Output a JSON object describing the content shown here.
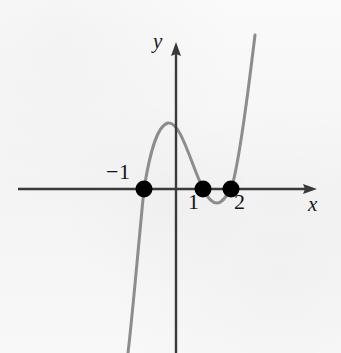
{
  "figure": {
    "kind": "cartesian-graph",
    "background_color": "#f7f7f7",
    "width": 341,
    "height": 353
  },
  "axes": {
    "x_axis": {
      "label": "x",
      "color": "#3a3a3a",
      "y_pixel": 189,
      "x_start_pixel": 18,
      "x_end_pixel": 317,
      "arrow": "right"
    },
    "y_axis": {
      "label": "y",
      "color": "#3a3a3a",
      "x_pixel": 176,
      "y_start_pixel": 42,
      "y_end_pixel": 353,
      "arrow": "up"
    },
    "origin_pixel": {
      "x": 176,
      "y": 189
    },
    "pixels_per_unit_x": 28,
    "pixels_per_unit_y": 28
  },
  "tick_labels": [
    {
      "text": "−1",
      "value": -1,
      "position": "above-left"
    },
    {
      "text": "1",
      "value": 1,
      "position": "below-left"
    },
    {
      "text": "2",
      "value": 2,
      "position": "below-right"
    }
  ],
  "curve": {
    "color": "#8d8d8d",
    "stroke_width": 3,
    "description": "quartic-like polynomial with roots at x = -1, x = 1, x = 2"
  },
  "points": {
    "color": "#000000",
    "radius": 8,
    "items": [
      {
        "label": "−1",
        "x": -1,
        "y": 0,
        "px": 144,
        "py": 189
      },
      {
        "label": "1",
        "x": 1,
        "y": 0,
        "px": 203,
        "py": 189
      },
      {
        "label": "2",
        "x": 2,
        "y": 0,
        "px": 231,
        "py": 189
      }
    ]
  },
  "chart_data": {
    "type": "line",
    "title": "",
    "xlabel": "x",
    "ylabel": "y",
    "grid": false,
    "legend": null,
    "xlim": [
      -5.6,
      5.0
    ],
    "ylim": [
      -5.9,
      5.3
    ],
    "roots": [
      -1,
      1,
      2
    ],
    "marked_points": [
      {
        "x": -1,
        "y": 0
      },
      {
        "x": 1,
        "y": 0
      },
      {
        "x": 2,
        "y": 0
      }
    ],
    "local_extrema": [
      {
        "type": "local-maximum",
        "x": -0.29,
        "y": 2.36
      },
      {
        "type": "local-minimum",
        "x": 1.46,
        "y": -0.5
      }
    ],
    "annotations": [
      "−1",
      "1",
      "2"
    ],
    "series": [
      {
        "name": "curve",
        "color": "#8d8d8d",
        "path_pixels": [
          [
            128,
            353
          ],
          [
            131,
            330
          ],
          [
            134,
            306
          ],
          [
            137,
            281
          ],
          [
            140,
            252
          ],
          [
            142,
            226
          ],
          [
            144,
            189
          ],
          [
            147,
            168
          ],
          [
            150,
            152
          ],
          [
            154,
            139
          ],
          [
            158,
            130
          ],
          [
            163,
            124
          ],
          [
            168,
            123
          ],
          [
            173,
            125
          ],
          [
            178,
            131
          ],
          [
            183,
            141
          ],
          [
            188,
            155
          ],
          [
            193,
            170
          ],
          [
            198,
            182
          ],
          [
            203,
            189
          ],
          [
            208,
            196
          ],
          [
            212,
            201
          ],
          [
            217,
            203
          ],
          [
            222,
            201
          ],
          [
            226,
            196
          ],
          [
            231,
            189
          ],
          [
            235,
            176
          ],
          [
            239,
            158
          ],
          [
            243,
            134
          ],
          [
            247,
            106
          ],
          [
            250,
            80
          ],
          [
            253,
            52
          ],
          [
            255,
            35
          ]
        ]
      }
    ]
  }
}
